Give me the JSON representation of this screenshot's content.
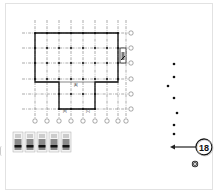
{
  "drawing": {
    "type": "architectural floor plan (structural grid)",
    "grid": {
      "vertical_lines_x": [
        35,
        47,
        59,
        71,
        83,
        95,
        107,
        118,
        126
      ],
      "horizontal_lines_y": [
        33,
        48,
        63,
        79,
        94,
        109
      ],
      "line_color": "#333333",
      "bubble_labels_bottom": [
        "",
        "",
        "",
        "",
        "",
        "",
        "",
        "",
        ""
      ],
      "bubble_labels_right": [
        "",
        "",
        "",
        "",
        "",
        ""
      ]
    },
    "room_tags": [
      "[A]",
      "[B]",
      "[C]"
    ],
    "legend_swatches_count": 5
  },
  "callout": {
    "number": "18",
    "arrow_direction": "left"
  },
  "dots": {
    "points": [
      [
        174,
        64
      ],
      [
        174,
        77
      ],
      [
        168,
        86
      ],
      [
        174,
        98
      ],
      [
        177,
        113
      ],
      [
        174,
        125
      ],
      [
        174,
        134
      ]
    ]
  },
  "colors": {
    "background": "#ffffff",
    "frame": "#e2e2e2",
    "ink": "#111111",
    "grid": "#444444"
  }
}
